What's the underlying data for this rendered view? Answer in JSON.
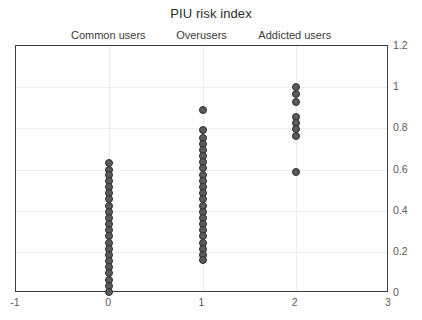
{
  "chart_data": {
    "type": "scatter",
    "title": "PIU risk index",
    "xlabel": "",
    "ylabel": "",
    "xlim": [
      -1,
      3
    ],
    "ylim": [
      0,
      1.2
    ],
    "grid": true,
    "legend": "none",
    "x_ticks": [
      "-1",
      "0",
      "1",
      "2",
      "3"
    ],
    "x_tick_values": [
      -1,
      0,
      1,
      2,
      3
    ],
    "y_ticks": [
      "0",
      "0.2",
      "0.4",
      "0.6",
      "0.8",
      "1",
      "1.2"
    ],
    "y_tick_values": [
      0,
      0.2,
      0.4,
      0.6,
      0.8,
      1,
      1.2
    ],
    "group_labels": [
      "Common users",
      "Overusers",
      "Addicted users"
    ],
    "group_label_x": [
      0,
      1,
      2
    ],
    "marker_color": "#5b5b5b",
    "marker_edge_color": "#2e2e2e",
    "frame_color": "#3c3c3c",
    "grid_color": "#ededed",
    "series": [
      {
        "name": "Common users",
        "x": 0,
        "values": [
          0.63,
          0.6,
          0.575,
          0.545,
          0.515,
          0.485,
          0.455,
          0.425,
          0.395,
          0.365,
          0.335,
          0.305,
          0.275,
          0.245,
          0.215,
          0.185,
          0.155,
          0.125,
          0.095,
          0.065,
          0.035,
          0.005
        ]
      },
      {
        "name": "Overusers",
        "x": 1,
        "values": [
          0.89,
          0.79,
          0.755,
          0.725,
          0.695,
          0.665,
          0.635,
          0.605,
          0.575,
          0.545,
          0.515,
          0.485,
          0.455,
          0.425,
          0.395,
          0.365,
          0.335,
          0.305,
          0.275,
          0.245,
          0.215,
          0.185,
          0.16
        ]
      },
      {
        "name": "Addicted users",
        "x": 2,
        "values": [
          1.0,
          0.965,
          0.93,
          0.855,
          0.825,
          0.795,
          0.765,
          0.59
        ]
      }
    ]
  }
}
